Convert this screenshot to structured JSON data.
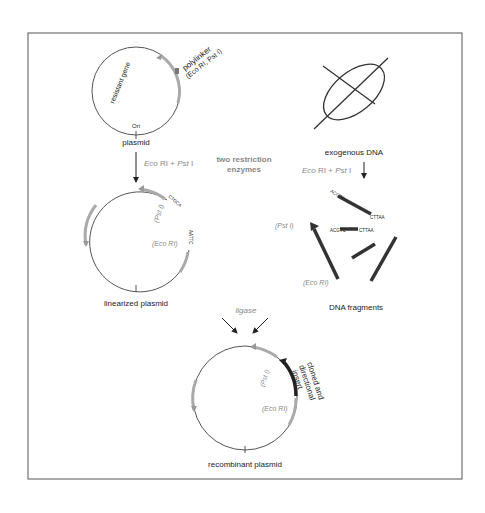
{
  "diagram": {
    "plasmid": {
      "label": "plasmid",
      "gene": "resistant gene",
      "polylinker": "polylinker",
      "polylinker_sites": "(Eco RI, Pst I)",
      "ori": "Ori"
    },
    "exogenous": {
      "label": "exogenous DNA"
    },
    "enzymes": {
      "left_label_1": "Eco",
      "left_label_2": " RI + ",
      "left_label_3": "Pst",
      "left_label_4": " I",
      "center_line1": "two restriction",
      "center_line2": "enzymes"
    },
    "linearized": {
      "label": "linearized plasmid",
      "pst": "(Pst I)",
      "eco": "(Eco RI)",
      "seq_pst": "CTGCA",
      "seq_pst_g": "G",
      "seq_eco": "AATTC",
      "seq_eco_g": "G"
    },
    "fragments": {
      "label": "DNA fragments",
      "pst": "(Pst I)",
      "eco": "(Eco RI)",
      "seq_a": "ACGTC",
      "seq_g": "G",
      "seq_b": "CTTAA"
    },
    "ligase": {
      "label": "ligase"
    },
    "recombinant": {
      "label": "recombinant plasmid",
      "pst": "(Pst I)",
      "eco": "(Eco RI)",
      "insert_1": "cloned and",
      "insert_2": "directional",
      "insert_3": "insert"
    }
  },
  "colors": {
    "line": "#555555",
    "gene": "#aaaaaa",
    "fragment": "#333333",
    "frame": "#555555"
  }
}
